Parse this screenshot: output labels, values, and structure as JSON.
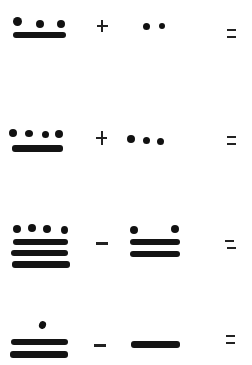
{
  "worksheet": {
    "topic": "Maya numerals arithmetic",
    "colors": {
      "ink": "#111111",
      "paper": "#ffffff"
    },
    "problems": [
      {
        "left": {
          "value": 8,
          "dots": 3,
          "bars": 1
        },
        "operator": "+",
        "right": {
          "value": 2,
          "dots": 2,
          "bars": 0
        },
        "equals": "=",
        "answer": ""
      },
      {
        "left": {
          "value": 9,
          "dots": 4,
          "bars": 1
        },
        "operator": "+",
        "right": {
          "value": 3,
          "dots": 3,
          "bars": 0
        },
        "equals": "=",
        "answer": ""
      },
      {
        "left": {
          "value": 19,
          "dots": 4,
          "bars": 3
        },
        "operator": "-",
        "right": {
          "value": 12,
          "dots": 2,
          "bars": 2
        },
        "equals": "=",
        "answer": ""
      },
      {
        "left": {
          "value": 11,
          "dots": 1,
          "bars": 2
        },
        "operator": "-",
        "right": {
          "value": 5,
          "dots": 0,
          "bars": 1
        },
        "equals": "=",
        "answer": ""
      }
    ]
  }
}
